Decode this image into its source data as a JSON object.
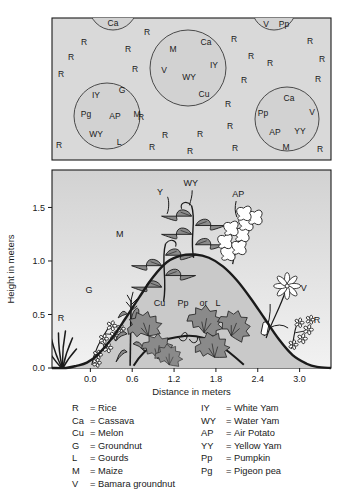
{
  "figure": {
    "panels": [
      "plan-view",
      "profile-view",
      "legend"
    ]
  },
  "colors": {
    "panel_fill": "#d9d9d9",
    "mound_fill": "#c9c9c9",
    "sky_top": "#d2d2d2",
    "sky_bottom": "#f2f2f2",
    "outline": "#1a1a1a",
    "plant_fill": "#8a8a8a",
    "background": "#ffffff"
  },
  "plan_view": {
    "name": "plan-view-panel",
    "scattered_label": "R",
    "scattered_rice": [
      {
        "t": "R",
        "x": 84,
        "y": 45
      },
      {
        "t": "R",
        "x": 71,
        "y": 60
      },
      {
        "t": "R",
        "x": 61,
        "y": 77
      },
      {
        "t": "R",
        "x": 128,
        "y": 52
      },
      {
        "t": "R",
        "x": 135,
        "y": 72
      },
      {
        "t": "R",
        "x": 147,
        "y": 35
      },
      {
        "t": "R",
        "x": 141,
        "y": 120
      },
      {
        "t": "R",
        "x": 59,
        "y": 148
      },
      {
        "t": "R",
        "x": 152,
        "y": 150
      },
      {
        "t": "R",
        "x": 190,
        "y": 154
      },
      {
        "t": "R",
        "x": 165,
        "y": 138
      },
      {
        "t": "R",
        "x": 200,
        "y": 137
      },
      {
        "t": "R",
        "x": 235,
        "y": 151
      },
      {
        "t": "R",
        "x": 320,
        "y": 152
      },
      {
        "t": "R",
        "x": 234,
        "y": 42
      },
      {
        "t": "R",
        "x": 251,
        "y": 59
      },
      {
        "t": "R",
        "x": 244,
        "y": 83
      },
      {
        "t": "R",
        "x": 270,
        "y": 66
      },
      {
        "t": "R",
        "x": 310,
        "y": 44
      },
      {
        "t": "R",
        "x": 322,
        "y": 62
      },
      {
        "t": "R",
        "x": 318,
        "y": 82
      },
      {
        "t": "R",
        "x": 228,
        "y": 107
      },
      {
        "t": "R",
        "x": 230,
        "y": 129
      }
    ],
    "mounds": [
      {
        "name": "mound-cassava-top",
        "cx": 113,
        "cy": 6,
        "r": 24,
        "clipped": true,
        "crops": [
          {
            "t": "Ca",
            "x": 113,
            "y": 26
          }
        ]
      },
      {
        "name": "mound-vpp-top-right",
        "cx": 274,
        "cy": 8,
        "r": 22,
        "clipped": true,
        "crops": [
          {
            "t": "V",
            "x": 266,
            "y": 27
          },
          {
            "t": "Pp",
            "x": 284,
            "y": 27
          }
        ]
      },
      {
        "name": "mound-center",
        "cx": 188,
        "cy": 68,
        "r": 38,
        "clipped": false,
        "crops": [
          {
            "t": "M",
            "x": 173,
            "y": 52
          },
          {
            "t": "Ca",
            "x": 206,
            "y": 45
          },
          {
            "t": "V",
            "x": 164,
            "y": 73
          },
          {
            "t": "WY",
            "x": 189,
            "y": 80
          },
          {
            "t": "IY",
            "x": 214,
            "y": 68
          },
          {
            "t": "Cu",
            "x": 204,
            "y": 97
          }
        ]
      },
      {
        "name": "mound-left",
        "cx": 107,
        "cy": 116,
        "r": 33,
        "clipped": false,
        "crops": [
          {
            "t": "IY",
            "x": 96,
            "y": 98
          },
          {
            "t": "G",
            "x": 122,
            "y": 93
          },
          {
            "t": "Pg",
            "x": 86,
            "y": 117
          },
          {
            "t": "AP",
            "x": 115,
            "y": 119
          },
          {
            "t": "M",
            "x": 137,
            "y": 117
          },
          {
            "t": "WY",
            "x": 96,
            "y": 137
          },
          {
            "t": "L",
            "x": 119,
            "y": 145
          }
        ]
      },
      {
        "name": "mound-right",
        "cx": 287,
        "cy": 119,
        "r": 32,
        "clipped": false,
        "crops": [
          {
            "t": "Ca",
            "x": 289,
            "y": 101
          },
          {
            "t": "Pp",
            "x": 263,
            "y": 116
          },
          {
            "t": "V",
            "x": 312,
            "y": 115
          },
          {
            "t": "AP",
            "x": 275,
            "y": 135
          },
          {
            "t": "YY",
            "x": 300,
            "y": 134
          },
          {
            "t": "M",
            "x": 286,
            "y": 150
          }
        ]
      }
    ]
  },
  "chart_data": {
    "type": "area",
    "title": "",
    "xlabel": "Distance in meters",
    "ylabel": "Height in meters",
    "xlim": [
      -0.55,
      3.45
    ],
    "ylim": [
      0.0,
      1.85
    ],
    "xticks": [
      "0.0",
      "0.6",
      "1.2",
      "1.8",
      "2.4",
      "3.0"
    ],
    "xtick_values": [
      0.0,
      0.6,
      1.2,
      1.8,
      2.4,
      3.0
    ],
    "yticks": [
      "0.0",
      "0.5",
      "1.0",
      "1.5"
    ],
    "ytick_values": [
      0.0,
      0.5,
      1.0,
      1.5
    ],
    "grid": false,
    "legend_position": "below-figure",
    "series": [
      {
        "name": "Mound profile",
        "description": "Soil mound cross-section height vs distance",
        "x": [
          -0.55,
          -0.35,
          -0.2,
          -0.05,
          0.1,
          0.3,
          0.5,
          0.7,
          0.9,
          1.1,
          1.3,
          1.5,
          1.7,
          1.9,
          2.1,
          2.3,
          2.5,
          2.7,
          2.9,
          3.1,
          3.25,
          3.45
        ],
        "values": [
          0.0,
          0.0,
          0.02,
          0.05,
          0.12,
          0.27,
          0.46,
          0.66,
          0.85,
          0.99,
          1.05,
          1.06,
          1.03,
          0.95,
          0.82,
          0.65,
          0.46,
          0.27,
          0.12,
          0.04,
          0.01,
          0.0
        ]
      }
    ],
    "annotations": [
      {
        "label": "R",
        "x": -0.42,
        "y": 0.44,
        "plant": "rice-grass"
      },
      {
        "label": "G",
        "x": -0.02,
        "y": 0.7,
        "plant": "groundnut-flowers"
      },
      {
        "label": "M",
        "x": 0.42,
        "y": 1.22,
        "plant": "maize"
      },
      {
        "label": "Y",
        "x": 1.0,
        "y": 1.62,
        "plant": "yam-vine"
      },
      {
        "label": "WY",
        "x": 1.44,
        "y": 1.7,
        "plant": "water-yam-vine"
      },
      {
        "label": "AP",
        "x": 2.12,
        "y": 1.6,
        "plant": "air-potato-vine"
      },
      {
        "label": "Cu",
        "x": 0.99,
        "y": 0.58,
        "plant": "melon-creeper"
      },
      {
        "label": "Pp",
        "x": 1.33,
        "y": 0.58,
        "plant": "pumpkin-creeper"
      },
      {
        "label": "or",
        "x": 1.62,
        "y": 0.58,
        "plant": "none"
      },
      {
        "label": "L",
        "x": 1.83,
        "y": 0.58,
        "plant": "gourd-creeper"
      },
      {
        "label": "V",
        "x": 3.06,
        "y": 0.72,
        "plant": "bambara-groundnut"
      },
      {
        "label": "R",
        "x": 3.25,
        "y": 0.42,
        "plant": "rice-flowers"
      }
    ]
  },
  "legend": {
    "name": "crop-code-legend",
    "separator": "=",
    "left_column": [
      {
        "code": "R",
        "name": "Rice"
      },
      {
        "code": "Ca",
        "name": "Cassava"
      },
      {
        "code": "Cu",
        "name": "Melon"
      },
      {
        "code": "G",
        "name": "Groundnut"
      },
      {
        "code": "L",
        "name": "Gourds"
      },
      {
        "code": "M",
        "name": "Maize"
      },
      {
        "code": "V",
        "name": "Bamara groundnut"
      }
    ],
    "right_column": [
      {
        "code": "IY",
        "name": "White Yam"
      },
      {
        "code": "WY",
        "name": "Water Yam"
      },
      {
        "code": "AP",
        "name": "Air Potato"
      },
      {
        "code": "YY",
        "name": "Yellow Yam"
      },
      {
        "code": "Pp",
        "name": "Pumpkin"
      },
      {
        "code": "Pg",
        "name": "Pigeon pea"
      }
    ]
  }
}
